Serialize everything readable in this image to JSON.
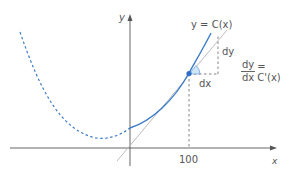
{
  "diagram": {
    "type": "derivative-tangent-illustration",
    "axes": {
      "x_label": "x",
      "y_label": "y",
      "x_tick": "100"
    },
    "curve": {
      "label": "y = C(x)",
      "color": "#3d7cc9",
      "dashed_segment": "x < 0",
      "solid_segment": "x >= 0"
    },
    "tangent": {
      "color": "#b5b5b5",
      "point_label": "x = 100"
    },
    "increments": {
      "dx_label": "dx",
      "dy_label": "dy"
    },
    "formula": {
      "numerator": "dy",
      "denominator": "dx",
      "rhs": "= C'(x)"
    },
    "colors": {
      "axis": "#555555",
      "curve": "#3d7cc9",
      "tangent": "#b5b5b5",
      "angle_fill": "#cfe6f7",
      "guide": "#666666"
    }
  }
}
